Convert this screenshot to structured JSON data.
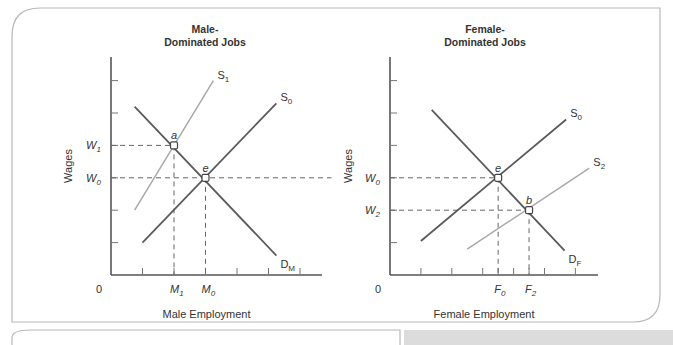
{
  "chart_data": [
    {
      "type": "line",
      "title": "Male-Dominated Jobs",
      "title_lines": [
        "Male-",
        "Dominated Jobs"
      ],
      "xlabel": "Male Employment",
      "ylabel": "Wages",
      "origin_label": "0",
      "xlim": [
        0,
        7
      ],
      "ylim": [
        0,
        7
      ],
      "x_ticks": [
        1,
        2,
        3,
        4,
        5,
        6
      ],
      "y_ticks": [
        1,
        2,
        3,
        4,
        5,
        6
      ],
      "x_tick_labels": [
        {
          "x": 2,
          "text": "M",
          "sub": "1"
        },
        {
          "x": 3,
          "text": "M",
          "sub": "0"
        }
      ],
      "y_tick_labels": [
        {
          "y": 4,
          "text": "W",
          "sub": "1"
        },
        {
          "y": 3,
          "text": "W",
          "sub": "0"
        }
      ],
      "series": [
        {
          "name": "D_M",
          "label": "D",
          "sub": "M",
          "style": "dark",
          "x": [
            0.75,
            5.25
          ],
          "y": [
            5.2,
            0.6
          ]
        },
        {
          "name": "S_1",
          "label": "S",
          "sub": "1",
          "style": "light",
          "x": [
            0.75,
            3.25
          ],
          "y": [
            2.0,
            6.0
          ]
        },
        {
          "name": "S_0",
          "label": "S",
          "sub": "0",
          "style": "dark",
          "x": [
            1.0,
            5.25
          ],
          "y": [
            1.0,
            5.3
          ]
        }
      ],
      "points": [
        {
          "name": "a",
          "x": 2,
          "y": 4
        },
        {
          "name": "e",
          "x": 3,
          "y": 3
        }
      ],
      "guides": [
        {
          "type": "h",
          "y": 4,
          "to_x": 2
        },
        {
          "type": "h",
          "y": 3,
          "to_x": 7
        },
        {
          "type": "v",
          "x": 2,
          "from_y": 4
        },
        {
          "type": "v",
          "x": 3,
          "from_y": 3
        }
      ]
    },
    {
      "type": "line",
      "title": "Female-Dominated Jobs",
      "title_lines": [
        "Female-",
        "Dominated Jobs"
      ],
      "xlabel": "Female Employment",
      "ylabel": "Wages",
      "origin_label": "0",
      "xlim": [
        0,
        7
      ],
      "ylim": [
        0,
        7
      ],
      "x_ticks": [
        1,
        2,
        3,
        3.5,
        4,
        4.5,
        5,
        6
      ],
      "y_ticks": [
        1,
        2,
        3,
        4,
        5,
        6
      ],
      "x_tick_labels": [
        {
          "x": 3.5,
          "text": "F",
          "sub": "0"
        },
        {
          "x": 4.5,
          "text": "F",
          "sub": "2"
        }
      ],
      "y_tick_labels": [
        {
          "y": 3,
          "text": "W",
          "sub": "0"
        },
        {
          "y": 2,
          "text": "W",
          "sub": "2"
        }
      ],
      "series": [
        {
          "name": "D_F",
          "label": "D",
          "sub": "F",
          "style": "dark",
          "x": [
            1.35,
            5.65
          ],
          "y": [
            5.1,
            0.75
          ]
        },
        {
          "name": "S_0",
          "label": "S",
          "sub": "0",
          "style": "dark",
          "x": [
            1.0,
            5.7
          ],
          "y": [
            1.05,
            4.8
          ]
        },
        {
          "name": "S_2",
          "label": "S",
          "sub": "2",
          "style": "light",
          "x": [
            2.5,
            6.45
          ],
          "y": [
            0.8,
            3.3
          ]
        }
      ],
      "points": [
        {
          "name": "e",
          "x": 3.5,
          "y": 3
        },
        {
          "name": "b",
          "x": 4.5,
          "y": 2
        }
      ],
      "guides": [
        {
          "type": "h",
          "y": 3,
          "to_x": 3.5
        },
        {
          "type": "h",
          "y": 2,
          "to_x": 4.5
        },
        {
          "type": "v",
          "x": 3.5,
          "from_y": 3
        },
        {
          "type": "v",
          "x": 4.5,
          "from_y": 2
        }
      ]
    }
  ]
}
